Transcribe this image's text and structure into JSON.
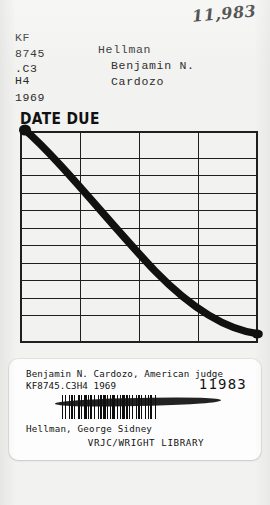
{
  "card": {
    "accession_handwritten": "11,983",
    "call_number_lines": [
      "KF",
      "8745",
      ".C3",
      "H4",
      "1969"
    ],
    "author_lines": [
      "Hellman",
      "Benjamin N.",
      "Cardozo"
    ],
    "date_due_heading": "DATE DUE",
    "grid": {
      "rows": 11,
      "columns": 4,
      "stamped_dates": []
    },
    "marker": {
      "description": "heavy black felt-tip cancellation stroke drawn diagonally across the date due grid",
      "color": "#111111"
    }
  },
  "label": {
    "title": "Benjamin N. Cardozo, American judge",
    "call_number": "KF8745.C3H4 1969",
    "item_number": "11983",
    "barcode_alt": "barcode",
    "author": "Hellman, George Sidney",
    "library": "VRJC/WRIGHT LIBRARY"
  },
  "colors": {
    "card_background": "#f2f2f0",
    "ink": "#1a1a1a",
    "label_background": "#fdfdfd"
  }
}
